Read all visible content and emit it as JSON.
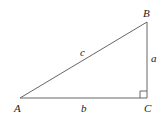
{
  "diagram": {
    "vertices": {
      "A": {
        "label": "A",
        "x": 20,
        "y": 98
      },
      "B": {
        "label": "B",
        "x": 147,
        "y": 22
      },
      "C": {
        "label": "C",
        "x": 147,
        "y": 98
      }
    },
    "sides": {
      "a": {
        "label": "a",
        "between": [
          "B",
          "C"
        ]
      },
      "b": {
        "label": "b",
        "between": [
          "A",
          "C"
        ]
      },
      "c": {
        "label": "c",
        "between": [
          "A",
          "B"
        ]
      }
    },
    "right_angle_at": "C",
    "colors": {
      "stroke": "#555555",
      "text": "#222222",
      "background": "#ffffff"
    }
  }
}
